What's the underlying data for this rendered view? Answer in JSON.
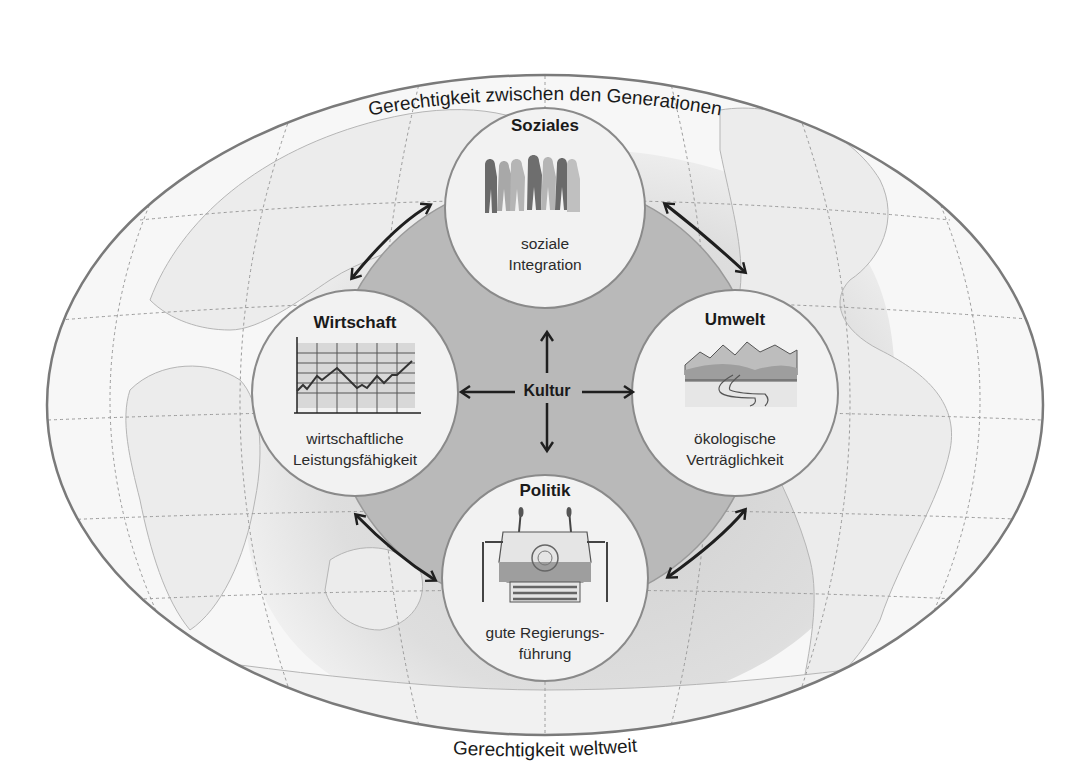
{
  "diagram": {
    "outer_arc_top": "Gerechtigkeit zwischen den Generationen",
    "outer_arc_bottom": "Gerechtigkeit weltweit",
    "center": {
      "label": "Kultur"
    },
    "nodes": [
      {
        "id": "soziales",
        "title": "Soziales",
        "subtitle_lines": [
          "soziale",
          "Integration"
        ],
        "icon": "people-group-icon"
      },
      {
        "id": "wirtschaft",
        "title": "Wirtschaft",
        "subtitle_lines": [
          "wirtschaftliche",
          "Leistungsfähigkeit"
        ],
        "icon": "line-chart-icon"
      },
      {
        "id": "umwelt",
        "title": "Umwelt",
        "subtitle_lines": [
          "ökologische",
          "Verträglichkeit"
        ],
        "icon": "mountain-river-icon"
      },
      {
        "id": "politik",
        "title": "Politik",
        "subtitle_lines": [
          "gute Regierungs-",
          "führung"
        ],
        "icon": "un-podium-icon"
      }
    ],
    "connections": [
      {
        "from": "wirtschaft",
        "to": "soziales",
        "type": "double-arrow"
      },
      {
        "from": "soziales",
        "to": "umwelt",
        "type": "double-arrow"
      },
      {
        "from": "wirtschaft",
        "to": "politik",
        "type": "double-arrow"
      },
      {
        "from": "politik",
        "to": "umwelt",
        "type": "double-arrow"
      },
      {
        "from": "kultur",
        "to": "soziales",
        "type": "arrow"
      },
      {
        "from": "kultur",
        "to": "wirtschaft",
        "type": "arrow"
      },
      {
        "from": "kultur",
        "to": "umwelt",
        "type": "arrow"
      },
      {
        "from": "kultur",
        "to": "politik",
        "type": "arrow"
      }
    ],
    "background": "world-map-ellipse",
    "colors": {
      "ellipse_stroke": "#7a7a7a",
      "center_fill": "#b9b9b9",
      "node_fill": "#f2f2f2",
      "node_stroke": "#8a8a8a",
      "arrow": "#1f1f1f",
      "land": "#e9e9e9",
      "ocean": "#d6d6d6"
    }
  }
}
